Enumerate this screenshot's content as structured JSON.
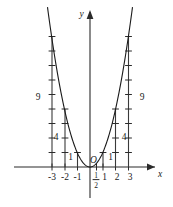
{
  "figure": {
    "background_color": "#ffffff",
    "ink_color": "#1a1a1a"
  },
  "axes": {
    "x_axis_label": "x",
    "y_axis_label": "y",
    "origin_label": "O",
    "x_tick_labels": [
      "-3",
      "-2",
      "-1",
      "1",
      "2",
      "3"
    ],
    "half_label_numerator": "1",
    "half_label_denominator": "2"
  },
  "ordinate_labels": {
    "left_nine": "9",
    "left_four": "4",
    "left_one": "1",
    "right_one": "1",
    "right_four": "4",
    "right_nine": "9"
  },
  "chart_data": {
    "type": "line",
    "title": "",
    "xlabel": "x",
    "ylabel": "y",
    "xlim": [
      -3.7,
      3.7
    ],
    "ylim": [
      -1.5,
      10.6
    ],
    "grid": false,
    "legend": "none",
    "function": "y = x^2",
    "curve": {
      "name": "y = x^2",
      "x": [
        -3.3,
        -3.0,
        -2.5,
        -2.0,
        -1.5,
        -1.0,
        -0.5,
        0.0,
        0.5,
        1.0,
        1.5,
        2.0,
        2.5,
        3.0,
        3.3
      ],
      "y": [
        10.89,
        9.0,
        6.25,
        4.0,
        2.25,
        1.0,
        0.25,
        0.0,
        0.25,
        1.0,
        2.25,
        4.0,
        6.25,
        9.0,
        10.89
      ]
    },
    "ordinate_segments": [
      {
        "x": -3,
        "height": 9,
        "label": "9",
        "ticks": 9
      },
      {
        "x": -2,
        "height": 4,
        "label": "4",
        "ticks": 4
      },
      {
        "x": -1,
        "height": 1,
        "label": "1",
        "ticks": 1
      },
      {
        "x": 1,
        "height": 1,
        "label": "1",
        "ticks": 1
      },
      {
        "x": 2,
        "height": 4,
        "label": "4",
        "ticks": 4
      },
      {
        "x": 3,
        "height": 9,
        "label": "9",
        "ticks": 9
      }
    ],
    "x_ticks": [
      -3,
      -2,
      -1,
      0.5,
      1,
      2,
      3
    ],
    "annotations": [
      {
        "text": "O",
        "x": 0,
        "y": 0,
        "note": "origin marker"
      },
      {
        "text": "1/2",
        "x": 0.5,
        "y": 0,
        "note": "half unit mark on x-axis"
      }
    ]
  }
}
